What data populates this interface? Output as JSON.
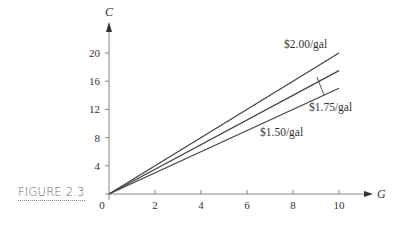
{
  "figure": {
    "caption": "FIGURE 2.3"
  },
  "chart_data": {
    "type": "line",
    "title": "",
    "xlabel": "G",
    "ylabel": "C",
    "xlim": [
      0,
      10
    ],
    "ylim": [
      0,
      20
    ],
    "x_ticks": [
      0,
      2,
      4,
      6,
      8,
      10
    ],
    "y_ticks": [
      4,
      8,
      12,
      16,
      20
    ],
    "x_tick_labels": [
      "0",
      "2",
      "4",
      "6",
      "8",
      "10"
    ],
    "y_tick_labels": [
      "4",
      "8",
      "12",
      "16",
      "20"
    ],
    "grid": false,
    "legend": "direct labels on lines",
    "series": [
      {
        "name": "$2.00/gal",
        "x": [
          0,
          10
        ],
        "values": [
          0,
          20
        ]
      },
      {
        "name": "$1.75/gal",
        "x": [
          0,
          10
        ],
        "values": [
          0,
          17.5
        ]
      },
      {
        "name": "$1.50/gal",
        "x": [
          0,
          10
        ],
        "values": [
          0,
          15
        ]
      }
    ]
  },
  "colors": {
    "line": "#444444",
    "axis": "#888888",
    "text": "#333333",
    "caption": "#6b6b6b"
  }
}
